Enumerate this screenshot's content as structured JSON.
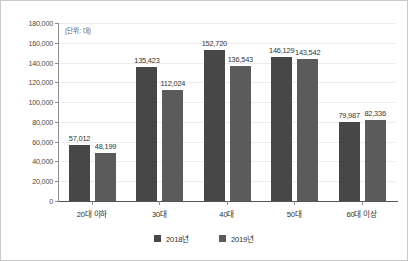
{
  "chart_data": {
    "type": "bar",
    "title": "",
    "subtitle": "",
    "unit_note": "(단위: 대)",
    "xlabel": "",
    "ylabel": "",
    "categories": [
      "20대 이하",
      "30대",
      "40대",
      "50대",
      "60대 이상"
    ],
    "series": [
      {
        "name": "2018년",
        "color": "#474747",
        "values": [
          57012,
          135423,
          152720,
          146129,
          79987
        ],
        "labels": [
          "57,012",
          "135,423",
          "152,720",
          "146,129",
          "79,987"
        ]
      },
      {
        "name": "2019년",
        "color": "#5b5b5b",
        "values": [
          48199,
          112024,
          136543,
          143542,
          82336
        ],
        "labels": [
          "48,199",
          "112,024",
          "136,543",
          "143,542",
          "82,336"
        ]
      }
    ],
    "ylim": [
      0,
      180000
    ],
    "ytick_values": [
      0,
      20000,
      40000,
      60000,
      80000,
      100000,
      120000,
      140000,
      160000,
      180000
    ],
    "ytick_labels": [
      "0",
      "20,000",
      "40,000",
      "60,000",
      "80,000",
      "100,000",
      "120,000",
      "140,000",
      "160,000",
      "180,000"
    ],
    "grid": true,
    "legend_position": "bottom",
    "legend": [
      "2018년",
      "2019년"
    ]
  },
  "colors": {
    "series_2018": "#474747",
    "series_2019": "#5b5b5b",
    "grid": "#ececec",
    "axis": "#8c8c8c",
    "border": "#c9c9c9",
    "background": "#ffffff",
    "text": "#2e2e2e"
  }
}
